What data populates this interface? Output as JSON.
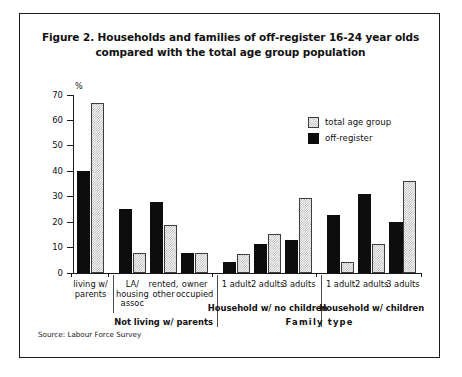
{
  "figure": {
    "title_line1": "Figure 2. Households and families of off-register 16-24 year olds",
    "title_line2": "compared with the total age group population",
    "source": "Source: Labour Force Survey"
  },
  "legend": {
    "items": [
      {
        "label": "total age group",
        "style": "hatched",
        "color": "#a8a8a8"
      },
      {
        "label": "off-register",
        "style": "solid",
        "color": "#0d0d0d"
      }
    ]
  },
  "axis": {
    "y_unit": "%",
    "y_ticks": [
      0,
      10,
      20,
      30,
      40,
      50,
      60,
      70
    ],
    "x_super_label": "Family type"
  },
  "groups": [
    {
      "label": "",
      "span_categories": 1
    },
    {
      "label": "Not living w/ parents",
      "span_categories": 3
    },
    {
      "label": "Household w/ no children",
      "span_categories": 3
    },
    {
      "label": "Household w/ children",
      "span_categories": 3
    }
  ],
  "chart_data": {
    "type": "bar",
    "title": "Figure 2. Households and families of off-register 16-24 year olds compared with the total age group population",
    "xlabel": "Family type",
    "ylabel": "%",
    "ylim": [
      0,
      70
    ],
    "yticks": [
      0,
      10,
      20,
      30,
      40,
      50,
      60,
      70
    ],
    "grid": false,
    "legend_position": "upper-right",
    "source": "Source: Labour Force Survey",
    "categories": [
      "living w/ parents",
      "LA/ housing assoc",
      "rented, other",
      "owner occupied",
      "1 adult",
      "2 adults",
      "3 adults",
      "1 adult",
      "2 adults",
      "3 adults"
    ],
    "category_lines": [
      [
        "living w/",
        "parents"
      ],
      [
        "LA/",
        "housing",
        "assoc"
      ],
      [
        "rented,",
        "other"
      ],
      [
        "owner",
        "occupied"
      ],
      [
        "1 adult"
      ],
      [
        "2 adults"
      ],
      [
        "3 adults"
      ],
      [
        "1 adult"
      ],
      [
        "2 adults"
      ],
      [
        "3 adults"
      ]
    ],
    "group_labels": [
      "",
      "Not living w/ parents",
      "Household w/ no children",
      "Household w/ children"
    ],
    "series": [
      {
        "name": "off-register",
        "style": "solid",
        "color": "#0d0d0d",
        "values": [
          40,
          25,
          28,
          8,
          4.5,
          11.5,
          13,
          23,
          31,
          20
        ]
      },
      {
        "name": "total age group",
        "style": "hatched",
        "color": "#a8a8a8",
        "values": [
          67,
          8,
          19,
          8,
          7.5,
          15.5,
          29.5,
          4.5,
          11.5,
          36
        ]
      }
    ]
  }
}
